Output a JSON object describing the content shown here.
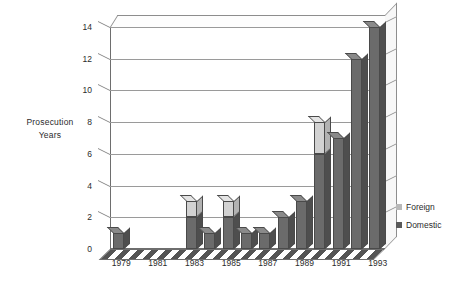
{
  "chart_data": {
    "type": "bar",
    "subtype": "stacked-column-3d",
    "title": "",
    "xlabel": "",
    "ylabel": "Prosecution Years",
    "ylim": [
      0,
      14
    ],
    "ytick_step": 2,
    "yticks": [
      0,
      2,
      4,
      6,
      8,
      10,
      12,
      14
    ],
    "grid": true,
    "legend_position": "right",
    "categories": [
      "1979",
      "1980",
      "1981",
      "1982",
      "1983",
      "1984",
      "1985",
      "1986",
      "1987",
      "1988",
      "1989",
      "1990",
      "1991",
      "1992",
      "1993"
    ],
    "xtick_labels": [
      "1979",
      "1981",
      "1983",
      "1985",
      "1987",
      "1989",
      "1991",
      "1993"
    ],
    "xtick_categories": [
      "1979",
      "1981",
      "1983",
      "1985",
      "1987",
      "1989",
      "1991",
      "1993"
    ],
    "series": [
      {
        "name": "Domestic",
        "color": "#6b6b6b",
        "values": [
          1,
          0,
          0,
          0,
          2,
          1,
          2,
          1,
          1,
          2,
          3,
          6,
          7,
          12,
          14
        ]
      },
      {
        "name": "Foreign",
        "color": "#d2d2d2",
        "values": [
          0,
          0,
          0,
          0,
          1,
          0,
          1,
          0,
          0,
          0,
          0,
          2,
          0,
          0,
          0
        ]
      }
    ],
    "totals": [
      1,
      0,
      0,
      0,
      3,
      1,
      3,
      1,
      1,
      2,
      3,
      8,
      7,
      12,
      14
    ]
  },
  "axis": {
    "y_title": "Prosecution Years",
    "y_title_line1": "Prosecution",
    "y_title_line2": "Years"
  },
  "legend": {
    "items": [
      {
        "label": "Foreign",
        "color": "#b9b9b9"
      },
      {
        "label": "Domestic",
        "color": "#595959"
      }
    ]
  }
}
